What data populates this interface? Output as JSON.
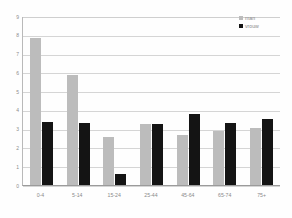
{
  "chart_data": {
    "type": "bar",
    "title": "",
    "xlabel": "",
    "ylabel": "",
    "ylim": [
      0,
      9
    ],
    "grid": true,
    "legend_position": "top-right",
    "categories": [
      "0-4",
      "5-14",
      "15-24",
      "25-44",
      "45-64",
      "65-74",
      "75+"
    ],
    "yticks": [
      "0",
      "1",
      "2",
      "3",
      "4",
      "5",
      "6",
      "7",
      "8",
      "9"
    ],
    "series": [
      {
        "name": "man",
        "color": "#bcbcbc",
        "values": [
          7.85,
          5.85,
          2.55,
          3.25,
          2.65,
          2.9,
          3.05
        ]
      },
      {
        "name": "vrouw",
        "color": "#141414",
        "values": [
          3.35,
          3.3,
          0.6,
          3.25,
          3.8,
          3.3,
          3.5
        ]
      }
    ]
  },
  "legend": {
    "items": [
      {
        "label": "man",
        "swatch": "legend-swatch-man"
      },
      {
        "label": "vrouw",
        "swatch": "legend-swatch-vrouw"
      }
    ]
  }
}
